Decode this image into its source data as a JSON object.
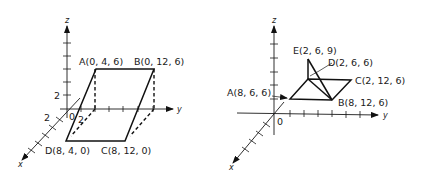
{
  "figure_left": {
    "axes": {
      "x": "x",
      "y": "y",
      "z": "z",
      "origin": "0",
      "tick_label_z": "2",
      "tick_label_x": "2",
      "tick_label_y": "2"
    },
    "points": {
      "A": "A(0, 4, 6)",
      "B": "B(0, 12, 6)",
      "C": "C(8, 12, 0)",
      "D": "D(8, 4, 0)"
    }
  },
  "figure_right": {
    "axes": {
      "x": "x",
      "y": "y",
      "z": "z",
      "origin": "0"
    },
    "points": {
      "A": "A(8, 6, 6)",
      "B": "B(8, 12, 6)",
      "C": "C(2, 12, 6)",
      "D": "D(2, 6, 6)",
      "E": "E(2, 6, 9)"
    }
  }
}
